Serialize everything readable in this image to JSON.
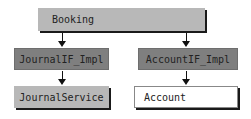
{
  "diagram": {
    "nodes": [
      {
        "id": "booking",
        "label": "Booking",
        "fill": "#b8b8b8"
      },
      {
        "id": "journal_if_impl",
        "label": "JournalIF_Impl",
        "fill": "#7f7f7f"
      },
      {
        "id": "account_if_impl",
        "label": "AccountIF_Impl",
        "fill": "#7f7f7f"
      },
      {
        "id": "journal_service",
        "label": "JournalService",
        "fill": "#b8b8b8"
      },
      {
        "id": "account",
        "label": "Account",
        "fill": "#ffffff"
      }
    ],
    "edges": [
      {
        "from": "booking",
        "to": "journal_if_impl"
      },
      {
        "from": "booking",
        "to": "account_if_impl"
      },
      {
        "from": "journal_if_impl",
        "to": "journal_service"
      },
      {
        "from": "account_if_impl",
        "to": "account"
      }
    ]
  }
}
